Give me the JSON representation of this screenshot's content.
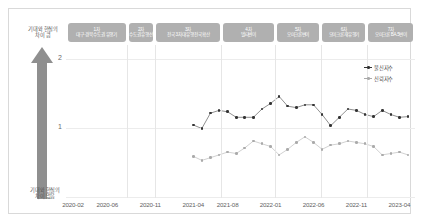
{
  "axis": {
    "arrow_top_label": "기대와 현실의\n차이 큼",
    "arrow_bottom_label": "기대와 현실의\n차이 없음",
    "y_ticks": [
      "2",
      "1"
    ],
    "x_ticks": [
      "2020-02",
      "2020-06",
      "2020-11",
      "2021-04",
      "2021-08",
      "2022-01",
      "2022-06",
      "2022-11",
      "2023-04"
    ]
  },
  "phases": [
    {
      "num": "1차",
      "label": "대구·경북 수도권 유행기"
    },
    {
      "num": "2차",
      "label": "수도권 유행선"
    },
    {
      "num": "3차",
      "label": "전국 3차 대유행 전국확산"
    },
    {
      "num": "4차",
      "label": "델타변이"
    },
    {
      "num": "5차",
      "label": "오미크론변이"
    },
    {
      "num": "6차",
      "label": "오미크론 재유행기"
    },
    {
      "num": "7차",
      "label": "오미크론 BA.5변이"
    }
  ],
  "legend": [
    {
      "name": "불신지수",
      "color": "#333333"
    },
    {
      "name": "신뢰지수",
      "color": "#aaaaaa"
    }
  ],
  "colors": {
    "pill_background": "#b0b0b0",
    "arrow": "#8f8f8f",
    "grid": "#e6e6e6",
    "frame_border": "#d9d9d9",
    "series_dark": "#333333",
    "series_light": "#aaaaaa"
  },
  "chart_data": {
    "type": "scatter",
    "title": "",
    "xlabel": "",
    "ylabel": "",
    "ylim": [
      0,
      2.2
    ],
    "grid": true,
    "legend_position": "right",
    "x": [
      "2020-02",
      "2020-03",
      "2020-04",
      "2020-05",
      "2020-06",
      "2020-07",
      "2020-08",
      "2020-09",
      "2020-10",
      "2020-11",
      "2020-12",
      "2021-01",
      "2021-02",
      "2021-03",
      "2021-04",
      "2021-05",
      "2021-06",
      "2021-07",
      "2021-08",
      "2021-09",
      "2021-10",
      "2021-11",
      "2021-12",
      "2022-01",
      "2022-02",
      "2022-03",
      "2022-04",
      "2022-05",
      "2022-06",
      "2022-07",
      "2022-08",
      "2022-09",
      "2022-10",
      "2022-11",
      "2022-12",
      "2023-01",
      "2023-02",
      "2023-03",
      "2023-04",
      "2023-05"
    ],
    "series": [
      {
        "name": "불신지수",
        "color": "#333333",
        "values": [
          null,
          null,
          null,
          null,
          null,
          null,
          null,
          null,
          null,
          null,
          null,
          null,
          null,
          null,
          1.05,
          1.0,
          1.22,
          1.26,
          1.24,
          1.16,
          1.16,
          1.16,
          1.28,
          1.36,
          1.46,
          1.32,
          1.3,
          1.34,
          1.34,
          1.2,
          1.04,
          1.16,
          1.28,
          1.26,
          1.2,
          1.17,
          1.26,
          1.2,
          1.16,
          1.17
        ]
      },
      {
        "name": "신뢰지수",
        "color": "#aaaaaa",
        "values": [
          null,
          null,
          null,
          null,
          null,
          null,
          null,
          null,
          null,
          null,
          null,
          null,
          null,
          null,
          0.6,
          0.54,
          0.58,
          0.62,
          0.66,
          0.64,
          0.72,
          0.82,
          0.78,
          0.74,
          0.62,
          0.7,
          0.8,
          0.88,
          0.8,
          0.7,
          0.76,
          0.78,
          0.82,
          0.8,
          0.78,
          0.74,
          0.62,
          0.64,
          0.66,
          0.62
        ]
      }
    ]
  }
}
